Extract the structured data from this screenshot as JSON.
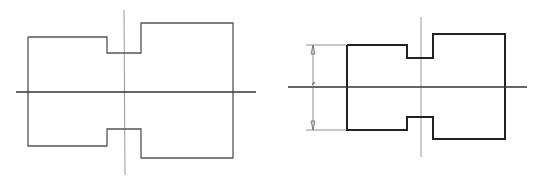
{
  "figure": {
    "width": 537,
    "height": 180,
    "background": "#ffffff",
    "colors": {
      "outline_thin": "#555555",
      "outline_thick": "#222222",
      "centerline": "#9a9a9a",
      "axis": "#333333",
      "dimension": "#777777"
    }
  },
  "left_drawing": {
    "label": "stepped shaft outline (thin lines)",
    "outline_points": "28,37 107,37 107,53 141,53 141,23 233,23 233,158 141,158 141,129 107,129 107,146 28,146 28,37",
    "horizontal_axis": {
      "x1": 16,
      "y1": 92,
      "x2": 256,
      "y2": 92
    },
    "vertical_centerline": {
      "x1": 124,
      "y1": 10,
      "x2": 125,
      "y2": 175
    }
  },
  "right_drawing": {
    "label": "stepped shaft outline (thick lines) with diameter dimension",
    "outline_points": "347,45 407,45 407,58 433,58 433,34 505,34 505,139 433,139 433,117 407,117 407,130 347,130 347,45",
    "horizontal_axis": {
      "x1": 288,
      "y1": 87,
      "x2": 527,
      "y2": 87
    },
    "vertical_centerline": {
      "x1": 421,
      "y1": 17,
      "x2": 421,
      "y2": 157
    },
    "dimension": {
      "line_x": 313,
      "top_y": 45,
      "bottom_y": 130,
      "extension_start_x": 306,
      "extension_end_x": 346
    }
  }
}
